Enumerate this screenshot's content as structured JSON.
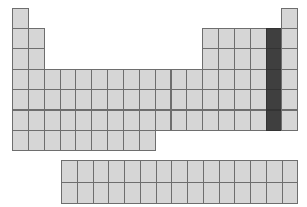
{
  "diagram": {
    "type": "periodic-table-blank",
    "highlighted_group": 17,
    "highlighted_rows": [
      2,
      3,
      4,
      5,
      6
    ],
    "colors": {
      "cell": "#d6d6d6",
      "border": "#6e6e6e",
      "highlight": "#3f3f3f",
      "background": "#ffffff"
    },
    "grid": {
      "left": 12,
      "top": 7.5,
      "cell_w": 15.85,
      "cell_h": 20.4
    },
    "rows": [
      {
        "period": 1,
        "groups": [
          1,
          18
        ]
      },
      {
        "period": 2,
        "groups": [
          1,
          2,
          13,
          14,
          15,
          16,
          17,
          18
        ]
      },
      {
        "period": 3,
        "groups": [
          1,
          2,
          13,
          14,
          15,
          16,
          17,
          18
        ]
      },
      {
        "period": 4,
        "groups": [
          1,
          2,
          3,
          4,
          5,
          6,
          7,
          8,
          9,
          10,
          11,
          12,
          13,
          14,
          15,
          16,
          17,
          18
        ]
      },
      {
        "period": 5,
        "groups": [
          1,
          2,
          3,
          4,
          5,
          6,
          7,
          8,
          9,
          10,
          11,
          12,
          13,
          14,
          15,
          16,
          17,
          18
        ]
      },
      {
        "period": 6,
        "groups": [
          1,
          2,
          3,
          4,
          5,
          6,
          7,
          8,
          9,
          10,
          11,
          12,
          13,
          14,
          15,
          16,
          17,
          18
        ]
      },
      {
        "period": 7,
        "groups": [
          1,
          2,
          3,
          4,
          5,
          6,
          7,
          8,
          9
        ]
      }
    ],
    "f_block": {
      "left": 61,
      "top": 160,
      "cols": 15,
      "rows": 2,
      "cell_w": 15.75,
      "cell_h": 21.5
    }
  }
}
